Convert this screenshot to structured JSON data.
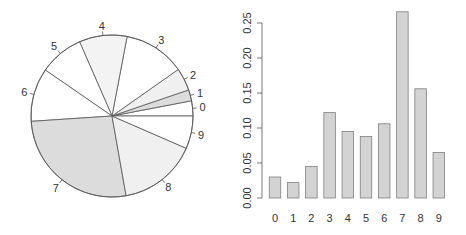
{
  "chart_data": [
    {
      "type": "pie",
      "title": "",
      "labels": [
        "0",
        "1",
        "2",
        "3",
        "4",
        "5",
        "6",
        "7",
        "8",
        "9"
      ],
      "values": [
        0.03,
        0.022,
        0.045,
        0.122,
        0.095,
        0.088,
        0.106,
        0.266,
        0.156,
        0.065
      ],
      "colors": [
        "#ffffff",
        "#dcdcdc",
        "#f0f0f0",
        "#ffffff",
        "#f3f3f3",
        "#ffffff",
        "#ffffff",
        "#dcdcdc",
        "#f0f0f0",
        "#ffffff"
      ],
      "start_angle_deg": 0,
      "direction": "counterclockwise",
      "center": [
        112,
        116
      ],
      "radius": 81
    },
    {
      "type": "bar",
      "title": "",
      "categories": [
        "0",
        "1",
        "2",
        "3",
        "4",
        "5",
        "6",
        "7",
        "8",
        "9"
      ],
      "values": [
        0.03,
        0.022,
        0.045,
        0.122,
        0.095,
        0.088,
        0.106,
        0.266,
        0.156,
        0.065
      ],
      "xlabel": "",
      "ylabel": "",
      "ylim": [
        0,
        0.27
      ],
      "yticks": [
        "0.00",
        "0.05",
        "0.10",
        "0.15",
        "0.20",
        "0.25"
      ],
      "grid": false,
      "bar_color": "#d3d3d3",
      "bar_border": "#7f7f7f"
    }
  ]
}
